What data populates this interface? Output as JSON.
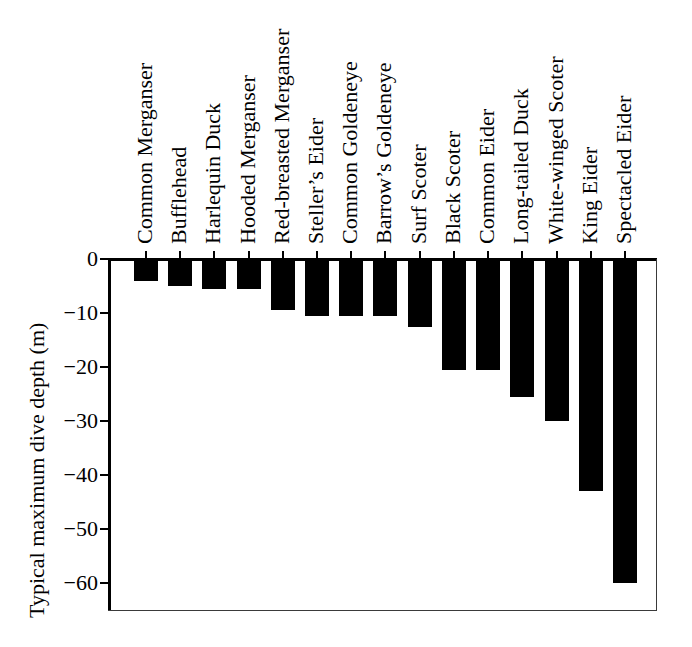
{
  "chart_data": {
    "type": "bar",
    "title": "",
    "xlabel": "",
    "ylabel": "Typical maximum dive depth (m)",
    "unit": "m",
    "categories": [
      "Common Merganser",
      "Bufflehead",
      "Harlequin Duck",
      "Hooded Merganser",
      "Red-breasted Merganser",
      "Steller’s Eider",
      "Common Goldeneye",
      "Barrow’s Goldeneye",
      "Surf Scoter",
      "Black Scoter",
      "Common Eider",
      "Long-tailed Duck",
      "White-winged Scoter",
      "King Eider",
      "Spectacled Eider"
    ],
    "values": [
      -4,
      -5,
      -5.5,
      -5.5,
      -9.5,
      -10.5,
      -10.5,
      -10.5,
      -12.5,
      -20.5,
      -20.5,
      -25.5,
      -30,
      -43,
      -60
    ],
    "yticks": [
      0,
      -10,
      -20,
      -30,
      -40,
      -50,
      -60
    ],
    "ytick_labels": [
      "0",
      "−10",
      "−20",
      "−30",
      "−40",
      "−50",
      "−60"
    ],
    "ylim": [
      -65,
      0
    ],
    "grid": false,
    "legend": "none",
    "bar_color": "#000000",
    "orientation": "vertical-downward"
  }
}
